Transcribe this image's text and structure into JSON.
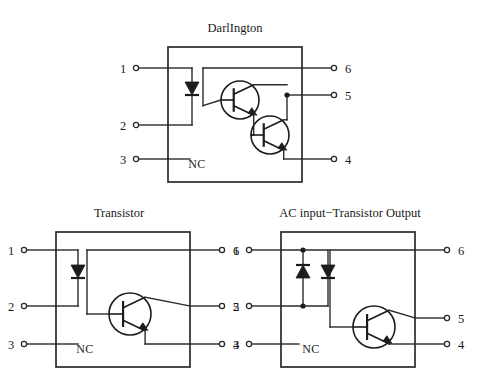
{
  "page": {
    "background": "#ffffff",
    "ink": "#1a1a1a",
    "width": 478,
    "height": 379
  },
  "diagrams": [
    {
      "id": "darlington",
      "title": "DarlIngton",
      "title_x": 235,
      "title_y": 12,
      "origin_x": 130,
      "origin_y": 20,
      "package": {
        "x": 38,
        "y": 27,
        "w": 134,
        "h": 135
      },
      "nc_label": "NC",
      "nc_x": 67,
      "nc_y": 143,
      "pins_left": [
        {
          "number": "1",
          "y": 48
        },
        {
          "number": "2",
          "y": 105
        },
        {
          "number": "3",
          "y": 139
        }
      ],
      "pins_right": [
        {
          "number": "6",
          "y": 48
        },
        {
          "number": "5",
          "y": 75
        },
        {
          "number": "4",
          "y": 139
        }
      ],
      "emitter_diodes": [
        {
          "x": 62,
          "y": 62,
          "dir": "down"
        }
      ],
      "transistors": [
        {
          "cx": 110,
          "cy": 80,
          "r": 19
        },
        {
          "cx": 140,
          "cy": 115,
          "r": 19
        }
      ],
      "junctions": [
        {
          "x": 157,
          "y": 75
        }
      ]
    },
    {
      "id": "transistor",
      "title": "Transistor",
      "title_x": 119,
      "title_y": 12,
      "origin_x": 10,
      "origin_y": 205,
      "package": {
        "x": 46,
        "y": 27,
        "w": 134,
        "h": 135
      },
      "nc_label": "NC",
      "nc_x": 75,
      "nc_y": 143,
      "pins_left": [
        {
          "number": "1",
          "y": 45
        },
        {
          "number": "2",
          "y": 101
        },
        {
          "number": "3",
          "y": 139
        }
      ],
      "pins_right": [
        {
          "number": "6",
          "y": 45
        },
        {
          "number": "5",
          "y": 101
        },
        {
          "number": "4",
          "y": 139
        }
      ],
      "emitter_diodes": [
        {
          "x": 68,
          "y": 60,
          "dir": "down"
        }
      ],
      "transistors": [
        {
          "cx": 120,
          "cy": 109,
          "r": 21
        }
      ],
      "junctions": []
    },
    {
      "id": "ac-input",
      "title": "AC input−Transistor Output",
      "title_x": 350,
      "title_y": 12,
      "origin_x": 243,
      "origin_y": 205,
      "package": {
        "x": 38,
        "y": 27,
        "w": 134,
        "h": 135
      },
      "nc_label": "NC",
      "nc_x": 68,
      "nc_y": 143,
      "pins_left": [
        {
          "number": "1",
          "y": 45
        },
        {
          "number": "2",
          "y": 101
        },
        {
          "number": "3",
          "y": 139
        }
      ],
      "pins_right": [
        {
          "number": "6",
          "y": 45
        },
        {
          "number": "5",
          "y": 113
        },
        {
          "number": "4",
          "y": 139
        }
      ],
      "emitter_diodes": [
        {
          "x": 60,
          "y": 60,
          "dir": "up"
        },
        {
          "x": 85,
          "y": 60,
          "dir": "down"
        }
      ],
      "transistors": [
        {
          "cx": 131,
          "cy": 122,
          "r": 21
        }
      ],
      "junctions": [
        {
          "x": 60,
          "y": 45
        },
        {
          "x": 60,
          "y": 101
        }
      ]
    }
  ],
  "chart_data": {
    "type": "diagram",
    "items": [
      {
        "name": "DarlIngton",
        "package_pins": 6,
        "input_side": {
          "pins": [
            "1",
            "2"
          ],
          "device": "LED",
          "count": 1
        },
        "no_connect_pin": "3",
        "output_side": {
          "pins": [
            "6",
            "5",
            "4"
          ],
          "device": "Darlington NPN pair",
          "count": 2
        }
      },
      {
        "name": "Transistor",
        "package_pins": 6,
        "input_side": {
          "pins": [
            "1",
            "2"
          ],
          "device": "LED",
          "count": 1
        },
        "no_connect_pin": "3",
        "output_side": {
          "pins": [
            "6",
            "5",
            "4"
          ],
          "device": "NPN phototransistor",
          "count": 1
        }
      },
      {
        "name": "AC input−Transistor Output",
        "package_pins": 6,
        "input_side": {
          "pins": [
            "1",
            "2"
          ],
          "device": "Antiparallel LED pair",
          "count": 2
        },
        "no_connect_pin": "3",
        "output_side": {
          "pins": [
            "6",
            "5",
            "4"
          ],
          "device": "NPN phototransistor",
          "count": 1
        }
      }
    ]
  }
}
